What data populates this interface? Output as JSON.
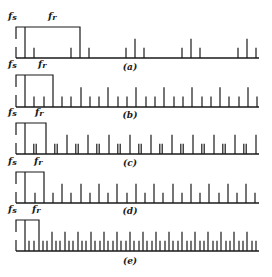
{
  "figure": {
    "panels": [
      {
        "caption": "(a)",
        "fs_label": "fs",
        "fr_label": "fr",
        "ratio_fr_over_fs": 6,
        "pattern": "tall line at each multiple of fr with short lines one fs either side"
      },
      {
        "caption": "(b)",
        "fs_label": "fs",
        "fr_label": "fr",
        "ratio_fr_over_fs": 3,
        "pattern": "tall line every 3rd fs line, short otherwise"
      },
      {
        "caption": "(c)",
        "fs_label": "fs",
        "fr_label": "fr",
        "ratio_fr_over_fs": 2.3,
        "pattern": "tall lines separated by double short lines"
      },
      {
        "caption": "(d)",
        "fs_label": "fs",
        "fr_label": "fr",
        "ratio_fr_over_fs": 2,
        "pattern": "alternating tall and short lines"
      },
      {
        "caption": "(e)",
        "fs_label": "fs",
        "fr_label": "fr",
        "ratio_fr_over_fs": 3,
        "pattern": "dense lines, tall line every 3rd with two short between"
      }
    ]
  }
}
